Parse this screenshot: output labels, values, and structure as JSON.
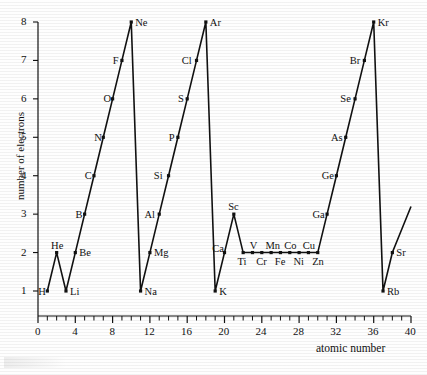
{
  "figure": {
    "kind": "scientific-line-chart",
    "ink_color": "#111111",
    "background_color": "#fefefe"
  },
  "axes": {
    "y_title": "number of electrons",
    "x_title": "atomic number",
    "y_ticks": [
      "1",
      "2",
      "3",
      "4",
      "5",
      "6",
      "7",
      "8"
    ],
    "x_ticks_major": [
      "0",
      "4",
      "8",
      "12",
      "16",
      "20",
      "24",
      "28",
      "32",
      "36",
      "40"
    ]
  },
  "chart_data": {
    "type": "line",
    "title": "",
    "xlabel": "atomic number",
    "ylabel": "number of electrons",
    "xlim": [
      0,
      40
    ],
    "ylim": [
      0,
      8
    ],
    "grid": false,
    "legend": "none",
    "x_tick_step_major": 4,
    "x_tick_step_minor": 1,
    "y_tick_step": 1,
    "series": [
      {
        "name": "number of outer-shell electrons",
        "x": [
          1,
          2,
          3,
          4,
          5,
          6,
          7,
          8,
          9,
          10,
          11,
          12,
          13,
          14,
          15,
          16,
          17,
          18,
          19,
          20,
          21,
          22,
          23,
          24,
          25,
          26,
          27,
          28,
          29,
          30,
          31,
          32,
          33,
          34,
          35,
          36,
          37,
          38
        ],
        "values": [
          1,
          2,
          1,
          2,
          3,
          4,
          5,
          6,
          7,
          8,
          1,
          2,
          3,
          4,
          5,
          6,
          7,
          8,
          1,
          2,
          3,
          2,
          2,
          2,
          2,
          2,
          2,
          2,
          2,
          2,
          3,
          4,
          5,
          6,
          7,
          8,
          1,
          2
        ],
        "point_labels": [
          "H",
          "He",
          "Li",
          "Be",
          "B",
          "C",
          "N",
          "O",
          "F",
          "Ne",
          "Na",
          "Mg",
          "Al",
          "Si",
          "P",
          "S",
          "Cl",
          "Ar",
          "K",
          "Ca",
          "Sc",
          "Ti",
          "V",
          "Cr",
          "Mn",
          "Fe",
          "Co",
          "Ni",
          "Cu",
          "Zn",
          "Ga",
          "Ge",
          "As",
          "Se",
          "Br",
          "Kr",
          "Rb",
          "Sr"
        ]
      }
    ],
    "trailing_segment": {
      "from": [
        38,
        2
      ],
      "to": [
        40,
        3.2
      ],
      "note": "line continues upward past Sr"
    },
    "annotations": [
      {
        "text": "H",
        "x": 1,
        "y": 1,
        "placement": "left"
      },
      {
        "text": "He",
        "x": 2,
        "y": 2,
        "placement": "above"
      },
      {
        "text": "Li",
        "x": 3,
        "y": 1,
        "placement": "right"
      },
      {
        "text": "Be",
        "x": 4,
        "y": 2,
        "placement": "right"
      },
      {
        "text": "B",
        "x": 5,
        "y": 3,
        "placement": "left"
      },
      {
        "text": "C",
        "x": 6,
        "y": 4,
        "placement": "left"
      },
      {
        "text": "N",
        "x": 7,
        "y": 5,
        "placement": "left"
      },
      {
        "text": "O",
        "x": 8,
        "y": 6,
        "placement": "left"
      },
      {
        "text": "F",
        "x": 9,
        "y": 7,
        "placement": "left"
      },
      {
        "text": "Ne",
        "x": 10,
        "y": 8,
        "placement": "right"
      },
      {
        "text": "Na",
        "x": 11,
        "y": 1,
        "placement": "right"
      },
      {
        "text": "Mg",
        "x": 12,
        "y": 2,
        "placement": "right"
      },
      {
        "text": "Al",
        "x": 13,
        "y": 3,
        "placement": "left"
      },
      {
        "text": "Si",
        "x": 14,
        "y": 4,
        "placement": "left"
      },
      {
        "text": "P",
        "x": 15,
        "y": 5,
        "placement": "left"
      },
      {
        "text": "S",
        "x": 16,
        "y": 6,
        "placement": "left"
      },
      {
        "text": "Cl",
        "x": 17,
        "y": 7,
        "placement": "left"
      },
      {
        "text": "Ar",
        "x": 18,
        "y": 8,
        "placement": "right"
      },
      {
        "text": "K",
        "x": 19,
        "y": 1,
        "placement": "right"
      },
      {
        "text": "Ca",
        "x": 20,
        "y": 2,
        "placement": "above-left"
      },
      {
        "text": "Sc",
        "x": 21,
        "y": 3,
        "placement": "above"
      },
      {
        "text": "Ti",
        "x": 22,
        "y": 2,
        "placement": "below"
      },
      {
        "text": "V",
        "x": 23,
        "y": 2,
        "placement": "above"
      },
      {
        "text": "Cr",
        "x": 24,
        "y": 2,
        "placement": "below"
      },
      {
        "text": "Mn",
        "x": 25,
        "y": 2,
        "placement": "above"
      },
      {
        "text": "Fe",
        "x": 26,
        "y": 2,
        "placement": "below"
      },
      {
        "text": "Co",
        "x": 27,
        "y": 2,
        "placement": "above"
      },
      {
        "text": "Ni",
        "x": 28,
        "y": 2,
        "placement": "below"
      },
      {
        "text": "Cu",
        "x": 29,
        "y": 2,
        "placement": "above"
      },
      {
        "text": "Zn",
        "x": 30,
        "y": 2,
        "placement": "below"
      },
      {
        "text": "Ga",
        "x": 31,
        "y": 3,
        "placement": "left"
      },
      {
        "text": "Ge",
        "x": 32,
        "y": 4,
        "placement": "left"
      },
      {
        "text": "As",
        "x": 33,
        "y": 5,
        "placement": "left"
      },
      {
        "text": "Se",
        "x": 34,
        "y": 6,
        "placement": "left"
      },
      {
        "text": "Br",
        "x": 35,
        "y": 7,
        "placement": "left"
      },
      {
        "text": "Kr",
        "x": 36,
        "y": 8,
        "placement": "right"
      },
      {
        "text": "Rb",
        "x": 37,
        "y": 1,
        "placement": "right"
      },
      {
        "text": "Sr",
        "x": 38,
        "y": 2,
        "placement": "right"
      }
    ]
  }
}
